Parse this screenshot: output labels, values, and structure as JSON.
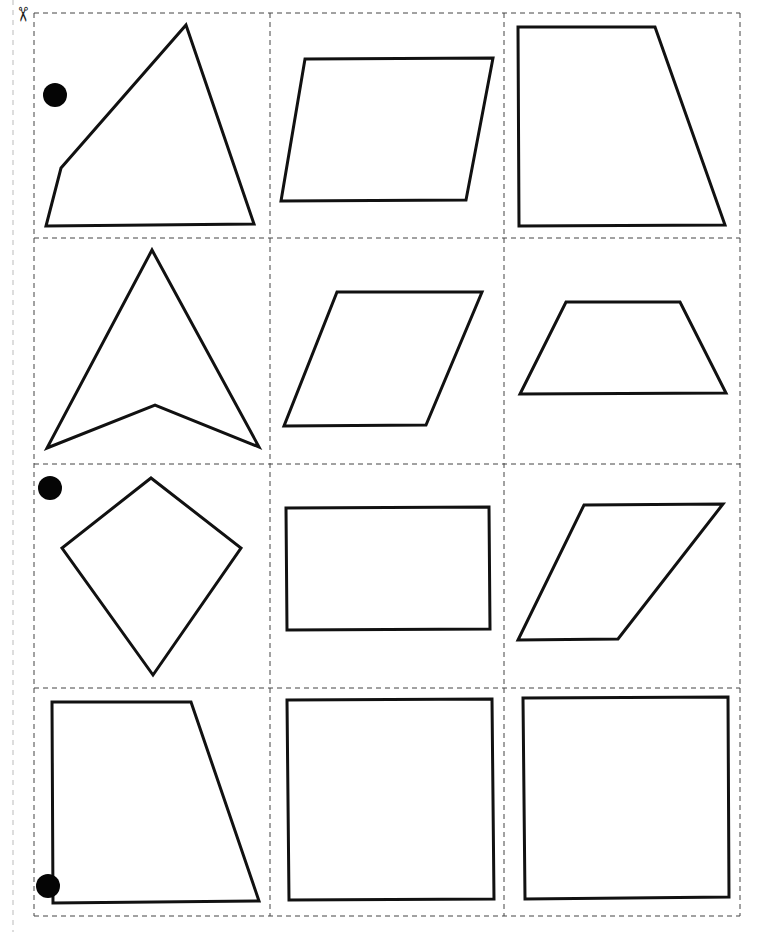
{
  "page": {
    "width": 763,
    "height": 932,
    "background": "#ffffff",
    "stroke_color": "#111111",
    "cut_line_color": "#444444"
  },
  "scissors_icon": {
    "name": "scissors-icon",
    "x": 24,
    "y": 16,
    "glyph": "✂"
  },
  "margin_line": {
    "x": 13,
    "y1": 0,
    "y2": 932
  },
  "grid": {
    "columns_x": [
      34,
      270,
      504,
      740
    ],
    "rows_y": [
      13,
      238,
      464,
      688,
      916
    ]
  },
  "punch_holes": [
    {
      "cx": 55,
      "cy": 95,
      "rx": 12,
      "ry": 12
    },
    {
      "cx": 50,
      "cy": 488,
      "rx": 12,
      "ry": 12
    },
    {
      "cx": 48,
      "cy": 886,
      "rx": 12,
      "ry": 12
    }
  ],
  "shapes": [
    {
      "id": "r1c1",
      "type": "irregular-quadrilateral",
      "points": "186,25 254,224 46,226 61,168"
    },
    {
      "id": "r1c2",
      "type": "parallelogram",
      "points": "305,59 493,58 466,200 281,201"
    },
    {
      "id": "r1c3",
      "type": "right-trapezoid",
      "points": "518,27 655,27 725,225 519,226"
    },
    {
      "id": "r2c1",
      "type": "concave-arrowhead",
      "points": "152,250 259,447 155,405 47,448"
    },
    {
      "id": "r2c2",
      "type": "rhombus",
      "points": "337,292 482,292 426,425 284,426"
    },
    {
      "id": "r2c3",
      "type": "isosceles-trapezoid",
      "points": "566,302 680,302 726,393 520,394"
    },
    {
      "id": "r3c1",
      "type": "kite",
      "points": "151,478 241,548 153,675 62,548"
    },
    {
      "id": "r3c2",
      "type": "rectangle",
      "points": "286,508 489,507 490,629 287,630"
    },
    {
      "id": "r3c3",
      "type": "parallelogram",
      "points": "584,505 723,504 618,639 518,640"
    },
    {
      "id": "r4c1",
      "type": "right-trapezoid",
      "points": "52,702 191,702 259,901 53,903"
    },
    {
      "id": "r4c2",
      "type": "rectangle",
      "points": "287,700 492,699 494,899 289,900"
    },
    {
      "id": "r4c3",
      "type": "square",
      "points": "523,698 728,697 729,897 525,899"
    }
  ]
}
